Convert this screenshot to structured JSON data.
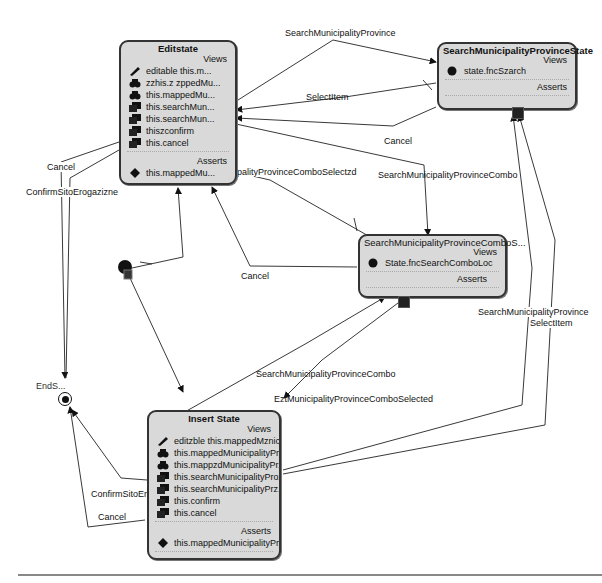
{
  "diagram": {
    "type": "state-machine",
    "states": {
      "edit": {
        "title": "Editstate",
        "views_label": "Views",
        "asserts_label": "Asserts",
        "views": [
          {
            "icon": "pencil-icon",
            "text": "editable this.m..."
          },
          {
            "icon": "binoculars-icon",
            "text": "zzhis.z zppedMu..."
          },
          {
            "icon": "binoculars-icon",
            "text": "this.mappedMu..."
          },
          {
            "icon": "cube-icon",
            "text": "this.searchMun..."
          },
          {
            "icon": "cube-icon",
            "text": "this.searchMun..."
          },
          {
            "icon": "cube-icon",
            "text": "thiszconfirm"
          },
          {
            "icon": "cube-icon",
            "text": "this.cancel"
          }
        ],
        "asserts": [
          {
            "icon": "diamond-icon",
            "text": "this.mappedMu..."
          }
        ]
      },
      "search_province": {
        "title": "SearchMunicipalityProvinceState",
        "views_label": "Views",
        "asserts_label": "Asserts",
        "views": [
          {
            "icon": "circle-icon",
            "text": "state.fncSzarch"
          }
        ]
      },
      "search_combo": {
        "title": "SearchMunicipalityProvinceComboS...",
        "views_label": "Views",
        "asserts_label": "Asserts",
        "views": [
          {
            "icon": "circle-icon",
            "text": "State.fncSearchComboLoc"
          }
        ]
      },
      "insert": {
        "title": "Insert State",
        "views_label": "Views",
        "asserts_label": "Asserts",
        "views": [
          {
            "icon": "pencil-icon",
            "text": "editzble this.mappedMznic..."
          },
          {
            "icon": "binoculars-icon",
            "text": "this.mappedMunicipalityPr..."
          },
          {
            "icon": "binoculars-icon",
            "text": "this.mappzdMunicipalityPr..."
          },
          {
            "icon": "cube-icon",
            "text": "this.searchMunicipalityProz..."
          },
          {
            "icon": "cube-icon",
            "text": "this.searchMunicipalityPrz..."
          },
          {
            "icon": "cube-icon",
            "text": "this.confirm"
          },
          {
            "icon": "cube-icon",
            "text": "this.cancel"
          }
        ],
        "asserts": [
          {
            "icon": "diamond-icon",
            "text": "this.mappedMunicipalityPr..."
          }
        ]
      },
      "end": {
        "title": "EndS..."
      }
    },
    "transitions": {
      "edit_to_search_province": "SearchMunicipalityProvince",
      "search_province_selectitem": "SelectItem",
      "search_province_cancel": "Cancel",
      "edit_to_search_combo": "SearchMunicipalityProvinceCombo",
      "combo_selected_to_edit": "EztMunicipalityProvinceComboSelectzd",
      "combo_cancel_to_edit": "Cancel",
      "edit_cancel": "Cancel",
      "edit_confirm": "ConfirmSitoErogazizne",
      "insert_to_search_combo": "SearchMunicipalityProvinceCombo",
      "combo_selected_to_insert": "EztMunicipalityProvinceComboSelected",
      "insert_to_search_province_line1": "SearchMunicipalityProvince",
      "insert_to_search_province_line2": "SelectItem",
      "insert_confirm": "ConfirmSitoErogazizne",
      "insert_cancel": "Cancel"
    }
  }
}
